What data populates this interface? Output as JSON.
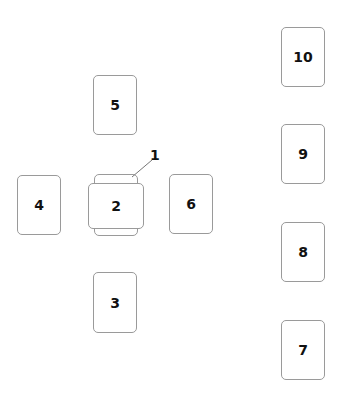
{
  "spread": {
    "title": "",
    "cards": [
      {
        "id": "1",
        "label": "1",
        "orientation": "vertical",
        "note": "covered by card 2"
      },
      {
        "id": "2",
        "label": "2",
        "orientation": "horizontal"
      },
      {
        "id": "3",
        "label": "3"
      },
      {
        "id": "4",
        "label": "4"
      },
      {
        "id": "5",
        "label": "5"
      },
      {
        "id": "6",
        "label": "6"
      },
      {
        "id": "7",
        "label": "7"
      },
      {
        "id": "8",
        "label": "8"
      },
      {
        "id": "9",
        "label": "9"
      },
      {
        "id": "10",
        "label": "10"
      }
    ],
    "callout": {
      "label": "1"
    }
  },
  "colors": {
    "card_border": "#9a9a9a",
    "text": "#111111",
    "background": "#ffffff",
    "pointer_line": "#777777"
  }
}
